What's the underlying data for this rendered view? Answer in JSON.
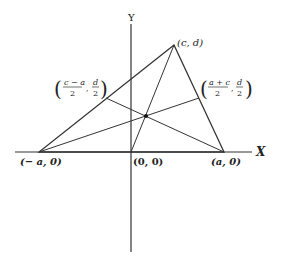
{
  "diagram": {
    "axes": {
      "x_label": "X",
      "y_label": "Y"
    },
    "points": {
      "left_vertex": "(− a, 0)",
      "right_vertex": "(a, 0)",
      "top_vertex": "(c, d)",
      "origin": "(0, 0)"
    },
    "midpoints": {
      "left": {
        "num1": "c − a",
        "den1": "2",
        "num2": "d",
        "den2": "2"
      },
      "right": {
        "num1": "a + c",
        "den1": "2",
        "num2": "d",
        "den2": "2"
      }
    },
    "colors": {
      "line": "#333333",
      "background": "#ffffff"
    }
  }
}
